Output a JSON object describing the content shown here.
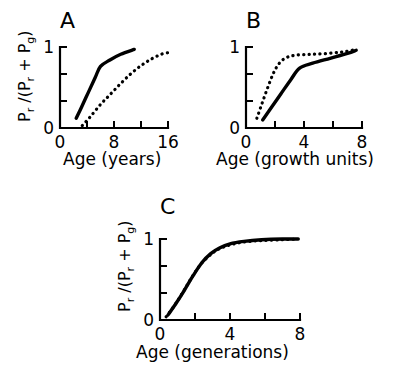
{
  "figure": {
    "background": "#ffffff",
    "ink_color": "#000000",
    "ylabel_parts": {
      "p1": "P",
      "sub1": "r",
      "slash": " /(",
      "p2": "P",
      "sub2": "r",
      "plus": " + ",
      "p3": "P",
      "sub3": "g",
      "close": ")"
    }
  },
  "chart_data": [
    {
      "panel": "A",
      "type": "line",
      "title": "A",
      "xlabel": "Age (years)",
      "ylabel": "Pr /(Pr + Pg)",
      "xlim": [
        0,
        16
      ],
      "ylim": [
        0,
        1
      ],
      "xticks": [
        0,
        4,
        8,
        12,
        16
      ],
      "xtick_labels": [
        "0",
        "",
        "8",
        "",
        "16"
      ],
      "yticks": [
        0,
        0.333,
        0.667,
        1
      ],
      "ytick_labels": [
        "0",
        "",
        "",
        "1"
      ],
      "grid": false,
      "legend": "none",
      "series": [
        {
          "name": "solid",
          "style": "solid",
          "x": [
            2.4,
            3.2,
            4.2,
            5.2,
            6.0,
            7.4,
            9.0,
            11.0
          ],
          "y": [
            0.12,
            0.26,
            0.44,
            0.62,
            0.76,
            0.84,
            0.91,
            0.97
          ]
        },
        {
          "name": "dotted",
          "style": "dotted",
          "x": [
            3.3,
            4.5,
            6.0,
            7.5,
            9.0,
            10.5,
            12.0,
            13.5,
            15.0,
            16.0
          ],
          "y": [
            0.03,
            0.14,
            0.29,
            0.42,
            0.55,
            0.67,
            0.77,
            0.85,
            0.91,
            0.93
          ]
        }
      ]
    },
    {
      "panel": "B",
      "type": "line",
      "title": "B",
      "xlabel": "Age (growth units)",
      "ylabel": "Pr /(Pr + Pg)",
      "xlim": [
        0,
        8
      ],
      "ylim": [
        0,
        1
      ],
      "xticks": [
        0,
        2,
        4,
        6,
        8
      ],
      "xtick_labels": [
        "0",
        "",
        "4",
        "",
        "8"
      ],
      "yticks": [
        0,
        0.333,
        0.667,
        1
      ],
      "ytick_labels": [
        "0",
        "",
        "",
        "1"
      ],
      "grid": false,
      "legend": "none",
      "series": [
        {
          "name": "solid",
          "style": "solid",
          "x": [
            1.15,
            1.7,
            2.4,
            3.1,
            3.7,
            4.6,
            5.8,
            7.0,
            7.6
          ],
          "y": [
            0.1,
            0.24,
            0.42,
            0.6,
            0.74,
            0.8,
            0.86,
            0.92,
            0.96
          ]
        },
        {
          "name": "dotted",
          "style": "dotted",
          "x": [
            0.75,
            1.1,
            1.5,
            1.9,
            2.3,
            2.8,
            3.5,
            4.5,
            5.6,
            6.7,
            7.6
          ],
          "y": [
            0.12,
            0.3,
            0.5,
            0.68,
            0.8,
            0.87,
            0.9,
            0.91,
            0.92,
            0.94,
            0.97
          ]
        }
      ]
    },
    {
      "panel": "C",
      "type": "line",
      "title": "C",
      "xlabel": "Age (generations)",
      "ylabel": "Pr /(Pr + Pg)",
      "xlim": [
        0,
        8
      ],
      "ylim": [
        0,
        1
      ],
      "xticks": [
        0,
        2,
        4,
        6,
        8
      ],
      "xtick_labels": [
        "0",
        "",
        "4",
        "",
        "8"
      ],
      "yticks": [
        0,
        0.333,
        0.667,
        1
      ],
      "ytick_labels": [
        "0",
        "",
        "",
        "1"
      ],
      "grid": false,
      "legend": "none",
      "series": [
        {
          "name": "solid",
          "style": "solid",
          "x": [
            0.45,
            0.9,
            1.4,
            1.9,
            2.4,
            2.9,
            3.4,
            4.0,
            4.8,
            5.8,
            7.0,
            7.9
          ],
          "y": [
            0.06,
            0.2,
            0.37,
            0.55,
            0.71,
            0.82,
            0.89,
            0.94,
            0.97,
            0.99,
            1.0,
            1.0
          ]
        },
        {
          "name": "dotted",
          "style": "dotted",
          "x": [
            0.35,
            0.8,
            1.3,
            1.8,
            2.3,
            2.8,
            3.3,
            3.9,
            4.7,
            5.7,
            6.9,
            7.9
          ],
          "y": [
            0.04,
            0.17,
            0.34,
            0.52,
            0.68,
            0.79,
            0.87,
            0.92,
            0.96,
            0.98,
            0.99,
            1.0
          ]
        }
      ]
    }
  ]
}
